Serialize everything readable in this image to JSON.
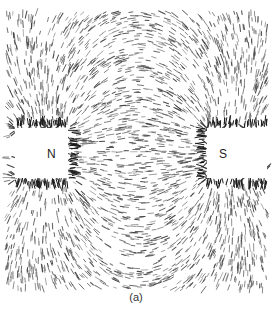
{
  "figure": {
    "caption": "(a)",
    "colors": {
      "background": "#ffffff",
      "filing": "#3a3a3a",
      "magnet_fill": "#ffffff",
      "magnet_edge": "#222222"
    },
    "magnets": [
      {
        "label": "N",
        "x": 15,
        "y": 128,
        "width": 53,
        "height": 50,
        "label_x": 47,
        "label_y": 158,
        "charge": 1
      },
      {
        "label": "S",
        "x": 207,
        "y": 128,
        "width": 60,
        "height": 50,
        "label_x": 219,
        "label_y": 158,
        "charge": -1
      }
    ],
    "field_region": {
      "x0": 6,
      "y0": 12,
      "x1": 268,
      "y1": 290
    },
    "poles": [
      {
        "x": 68,
        "y": 153,
        "q": 1
      },
      {
        "x": 207,
        "y": 153,
        "q": -1
      }
    ]
  }
}
